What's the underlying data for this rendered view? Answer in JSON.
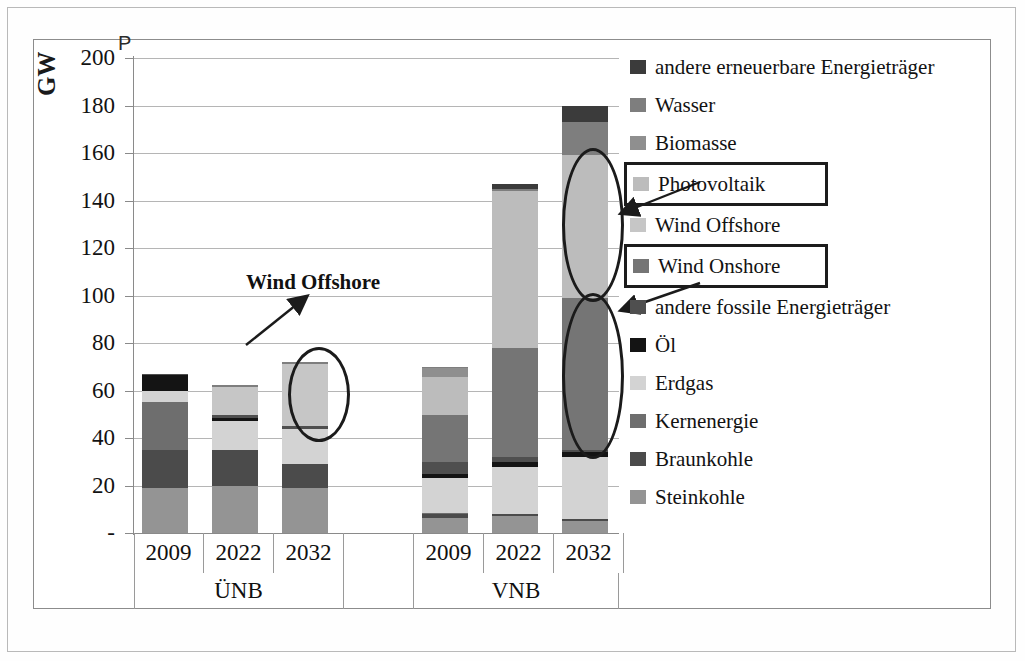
{
  "chart_data": {
    "type": "bar",
    "subtype": "stacked-bar-grouped",
    "title": "",
    "xlabel": "",
    "ylabel": "GW",
    "axis_corner_label": "P",
    "ylim": [
      0,
      200
    ],
    "ytick_labels": [
      "200",
      "180",
      "160",
      "140",
      "120",
      "100",
      "80",
      "60",
      "40",
      "20",
      "-"
    ],
    "yticks": [
      200,
      180,
      160,
      140,
      120,
      100,
      80,
      60,
      40,
      20,
      0
    ],
    "grid": true,
    "legend_position": "right",
    "groups": [
      {
        "name": "ÜNB",
        "categories": [
          "2009",
          "2022",
          "2032"
        ]
      },
      {
        "name": "VNB",
        "categories": [
          "2009",
          "2022",
          "2032"
        ]
      }
    ],
    "categories": [
      "2009",
      "2022",
      "2032",
      "2009",
      "2022",
      "2032"
    ],
    "series": [
      {
        "name": "Steinkohle",
        "color": "#949494",
        "values": [
          19.0,
          20.0,
          19.0,
          6.5,
          7.0,
          5.0
        ]
      },
      {
        "name": "Braunkohle",
        "color": "#4b4b4b",
        "values": [
          16.0,
          15.0,
          10.0,
          1.5,
          1.0,
          1.0
        ]
      },
      {
        "name": "Kernenergie",
        "color": "#6e6e6e",
        "values": [
          20.0,
          0.0,
          0.0,
          0.5,
          0.0,
          0.0
        ]
      },
      {
        "name": "Erdgas",
        "color": "#d3d3d3",
        "values": [
          5.0,
          12.0,
          15.0,
          14.5,
          20.0,
          26.0
        ]
      },
      {
        "name": "Öl",
        "color": "#141414",
        "values": [
          6.5,
          1.5,
          0.0,
          2.0,
          2.0,
          2.0
        ]
      },
      {
        "name": "andere fossile Energieträger",
        "color": "#4f4f4f",
        "values": [
          0.5,
          1.0,
          1.0,
          5.0,
          2.0,
          1.0
        ]
      },
      {
        "name": "Wind Onshore",
        "color": "#757575",
        "values": [
          0.0,
          0.0,
          0.0,
          19.5,
          46.0,
          64.0
        ]
      },
      {
        "name": "Wind Offshore",
        "color": "#c6c6c6",
        "values": [
          0.0,
          12.0,
          26.0,
          0.0,
          0.0,
          0.0
        ]
      },
      {
        "name": "Photovoltaik",
        "color": "#bcbcbc",
        "values": [
          0.0,
          0.0,
          0.0,
          16.0,
          66.0,
          60.0
        ]
      },
      {
        "name": "Biomasse",
        "color": "#8f8f8f",
        "values": [
          0.0,
          0.0,
          0.0,
          4.0,
          0.0,
          0.0
        ]
      },
      {
        "name": "Wasser",
        "color": "#7e7e7e",
        "values": [
          0.0,
          1.0,
          1.0,
          0.5,
          1.0,
          14.0
        ]
      },
      {
        "name": "andere erneuerbare Energieträger",
        "color": "#3b3b3b",
        "values": [
          0.0,
          0.0,
          0.0,
          0.0,
          2.0,
          7.0
        ]
      }
    ],
    "bar_totals": [
      67,
      62.5,
      72,
      70,
      147,
      180
    ],
    "annotations": [
      {
        "text": "Wind Offshore",
        "target_group": "ÜNB",
        "target_category": "2032",
        "target_series": "Wind Offshore"
      }
    ],
    "highlight_legend_entries": [
      "Photovoltaik",
      "Wind Onshore"
    ],
    "highlight_ellipses": [
      {
        "group": "ÜNB",
        "category": "2032",
        "series": "Wind Offshore",
        "range": [
          45,
          72
        ]
      },
      {
        "group": "VNB",
        "category": "2032",
        "series": "Photovoltaik",
        "range": [
          100,
          160
        ]
      },
      {
        "group": "VNB",
        "category": "2032",
        "series": "Wind Onshore",
        "range": [
          35,
          100
        ]
      }
    ]
  },
  "legend": {
    "items": [
      {
        "label": "andere erneuerbare Energieträger",
        "color": "#3b3b3b",
        "boxed": false
      },
      {
        "label": "Wasser",
        "color": "#7e7e7e",
        "boxed": false
      },
      {
        "label": "Biomasse",
        "color": "#8f8f8f",
        "boxed": false
      },
      {
        "label": "Photovoltaik",
        "color": "#bcbcbc",
        "boxed": true
      },
      {
        "label": "Wind Offshore",
        "color": "#c6c6c6",
        "boxed": false
      },
      {
        "label": "Wind Onshore",
        "color": "#757575",
        "boxed": true
      },
      {
        "label": "andere fossile Energieträger",
        "color": "#4f4f4f",
        "boxed": false
      },
      {
        "label": "Öl",
        "color": "#141414",
        "boxed": false
      },
      {
        "label": "Erdgas",
        "color": "#d3d3d3",
        "boxed": false
      },
      {
        "label": "Kernenergie",
        "color": "#6e6e6e",
        "boxed": false
      },
      {
        "label": "Braunkohle",
        "color": "#4b4b4b",
        "boxed": false
      },
      {
        "label": "Steinkohle",
        "color": "#949494",
        "boxed": false
      }
    ]
  },
  "colors": {
    "grid": "#b5b5b5",
    "axis": "#8a8a8a",
    "frame": "#8c8c8c",
    "page_border": "#b9b9b9",
    "annotation": "#1b1b1b",
    "background": "#ffffff"
  }
}
